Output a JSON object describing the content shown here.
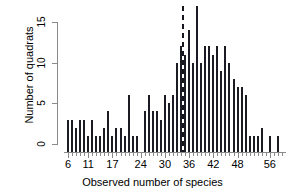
{
  "chart_data": {
    "type": "bar",
    "title": "",
    "subtitle": "",
    "xlabel": "Observed number of species",
    "ylabel": "Number of quadrats",
    "xlim": [
      5,
      60
    ],
    "ylim": [
      0,
      17
    ],
    "yticks": [
      0,
      5,
      10,
      15
    ],
    "xticks": [
      6,
      11,
      17,
      24,
      30,
      36,
      42,
      48,
      56
    ],
    "grid": false,
    "legend": null,
    "legend_position": "none",
    "bar_color": "#1b1b24",
    "axis_color": "#8a8a8a",
    "annotations": [
      {
        "name": "reference-line",
        "type": "vertical-dashed-line",
        "x": 34.5,
        "y_top": 17,
        "y_bottom": 0,
        "color": "#16161e"
      }
    ],
    "categories": [
      6,
      7,
      8,
      9,
      10,
      11,
      12,
      13,
      14,
      15,
      16,
      17,
      18,
      19,
      20,
      21,
      22,
      23,
      24,
      25,
      26,
      27,
      28,
      29,
      30,
      31,
      32,
      33,
      34,
      35,
      36,
      37,
      38,
      39,
      40,
      41,
      42,
      43,
      44,
      45,
      46,
      47,
      48,
      49,
      50,
      51,
      52,
      53,
      54,
      55,
      56,
      57,
      58,
      59
    ],
    "values": [
      3,
      3,
      2,
      3,
      3,
      1,
      3,
      1,
      1,
      2,
      4,
      1,
      2,
      2,
      1,
      6,
      1,
      1,
      0,
      4,
      6,
      4,
      4,
      3,
      6,
      5,
      6,
      10,
      12,
      11,
      14,
      10,
      17,
      10,
      12,
      12,
      11,
      12,
      9,
      12,
      10,
      8,
      7,
      7,
      6,
      1,
      1,
      1,
      2,
      0,
      1,
      0,
      1,
      0
    ]
  },
  "figure": {
    "axis": {
      "x_label": "Observed number of species",
      "y_label": "Number of quadrats",
      "y_tick_labels": [
        "0",
        "5",
        "10",
        "15"
      ],
      "x_tick_labels": [
        "6",
        "11",
        "17",
        "24",
        "30",
        "36",
        "42",
        "48",
        "56"
      ]
    }
  }
}
